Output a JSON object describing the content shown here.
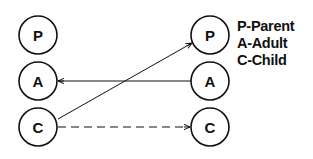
{
  "diagram": {
    "left_nodes": [
      {
        "id": "P",
        "label": "P"
      },
      {
        "id": "A",
        "label": "A"
      },
      {
        "id": "C",
        "label": "C"
      }
    ],
    "right_nodes": [
      {
        "id": "P",
        "label": "P"
      },
      {
        "id": "A",
        "label": "A"
      },
      {
        "id": "C",
        "label": "C"
      }
    ],
    "edges": [
      {
        "from": "right.A",
        "to": "left.A",
        "style": "solid",
        "arrow": "at-left"
      },
      {
        "from": "left.C",
        "to": "right.P",
        "style": "solid",
        "arrow": "at-right"
      },
      {
        "from": "left.C",
        "to": "right.C",
        "style": "dashed",
        "arrow": "at-right"
      }
    ],
    "legend": [
      {
        "text": "P-Parent"
      },
      {
        "text": "A-Adult"
      },
      {
        "text": "C-Child"
      }
    ],
    "colors": {
      "stroke": "#111111",
      "background": "#ffffff"
    }
  }
}
